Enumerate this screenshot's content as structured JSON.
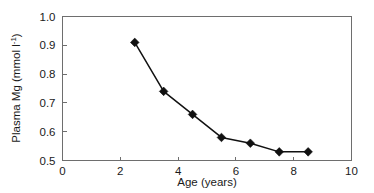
{
  "chart_data": {
    "type": "line",
    "title": "",
    "subtitle": "",
    "xlabel": "Age (years)",
    "ylabel": "Plasma Mg (mmol l⁻¹)",
    "ylabel_main": "Plasma Mg (mmol l",
    "ylabel_sup": "-1",
    "ylabel_tail": ")",
    "xlim": [
      0,
      10
    ],
    "ylim": [
      0.5,
      1.0
    ],
    "xticks": [
      0,
      2,
      4,
      6,
      8,
      10
    ],
    "xtick_labels": [
      "0",
      "2",
      "4",
      "6",
      "8",
      "10"
    ],
    "yticks": [
      0.5,
      0.6,
      0.7,
      0.8,
      0.9,
      1.0
    ],
    "ytick_labels": [
      "0.5",
      "0.6",
      "0.7",
      "0.8",
      "0.9",
      "1.0"
    ],
    "grid": false,
    "legend": false,
    "legend_position": "none",
    "marker": "diamond",
    "marker_color": "#111111",
    "line_color": "#111111",
    "axis_color": "#6e6e6e",
    "background": "#ffffff",
    "x": [
      2.5,
      3.5,
      4.5,
      5.5,
      6.5,
      7.5,
      8.5
    ],
    "values": [
      0.91,
      0.74,
      0.66,
      0.58,
      0.56,
      0.53,
      0.53
    ],
    "series": [
      {
        "name": "Plasma Mg",
        "x": [
          2.5,
          3.5,
          4.5,
          5.5,
          6.5,
          7.5,
          8.5
        ],
        "values": [
          0.91,
          0.74,
          0.66,
          0.58,
          0.56,
          0.53,
          0.53
        ]
      }
    ],
    "points": [
      {
        "x": 2.5,
        "y": 0.91
      },
      {
        "x": 3.5,
        "y": 0.74
      },
      {
        "x": 4.5,
        "y": 0.66
      },
      {
        "x": 5.5,
        "y": 0.58
      },
      {
        "x": 6.5,
        "y": 0.56
      },
      {
        "x": 7.5,
        "y": 0.53
      },
      {
        "x": 8.5,
        "y": 0.53
      }
    ],
    "annotations": []
  }
}
